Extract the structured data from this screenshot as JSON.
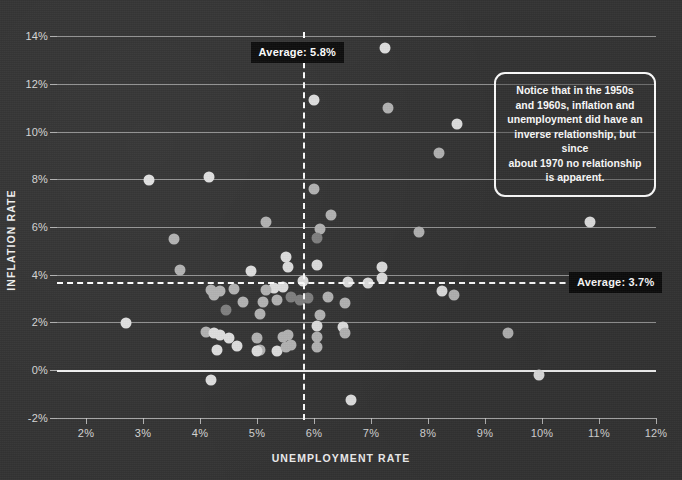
{
  "chart_data": {
    "type": "scatter",
    "title": "",
    "xlabel": "UNEMPLOYMENT RATE",
    "ylabel": "INFLATION RATE",
    "xlim": [
      1.5,
      12.5
    ],
    "ylim": [
      -2,
      14.6
    ],
    "grid": true,
    "x_ticks": [
      "2%",
      "3%",
      "4%",
      "5%",
      "6%",
      "7%",
      "8%",
      "9%",
      "10%",
      "11%",
      "12%"
    ],
    "x_tick_values": [
      2,
      3,
      4,
      5,
      6,
      7,
      8,
      9,
      10,
      11,
      12
    ],
    "y_ticks": [
      "-2%",
      "0%",
      "2%",
      "4%",
      "6%",
      "8%",
      "10%",
      "12%",
      "14%"
    ],
    "y_tick_values": [
      -2,
      0,
      2,
      4,
      6,
      8,
      10,
      12,
      14
    ],
    "reference_lines": [
      {
        "name": "average-unemployment",
        "orientation": "vertical",
        "value": 5.8,
        "label": "Average: 5.8%",
        "style": "dashed",
        "color": "#ffffff"
      },
      {
        "name": "average-inflation",
        "orientation": "horizontal",
        "value": 3.7,
        "label": "Average: 3.7%",
        "style": "dashed",
        "color": "#ffffff"
      }
    ],
    "annotation": "Notice that in the 1950s and 1960s, inflation and unemployment did have an inverse relationship, but since about 1970 no relationship is apparent.",
    "point_color_light": "#e0e0e0",
    "point_color_mid": "#b4b4b4",
    "point_color_dark": "#808080",
    "background_color": "#333333",
    "points": [
      {
        "x": 7.25,
        "y": 13.5,
        "shade": "light"
      },
      {
        "x": 6.0,
        "y": 11.3,
        "shade": "light"
      },
      {
        "x": 7.3,
        "y": 11.0,
        "shade": "mid"
      },
      {
        "x": 8.5,
        "y": 10.3,
        "shade": "light"
      },
      {
        "x": 8.2,
        "y": 9.1,
        "shade": "mid"
      },
      {
        "x": 3.1,
        "y": 7.95,
        "shade": "light"
      },
      {
        "x": 4.15,
        "y": 8.1,
        "shade": "light"
      },
      {
        "x": 6.0,
        "y": 7.6,
        "shade": "mid"
      },
      {
        "x": 6.3,
        "y": 6.5,
        "shade": "mid"
      },
      {
        "x": 5.15,
        "y": 6.2,
        "shade": "mid"
      },
      {
        "x": 6.1,
        "y": 5.9,
        "shade": "mid"
      },
      {
        "x": 6.05,
        "y": 5.55,
        "shade": "dark"
      },
      {
        "x": 10.85,
        "y": 6.2,
        "shade": "light"
      },
      {
        "x": 7.85,
        "y": 5.8,
        "shade": "mid"
      },
      {
        "x": 3.55,
        "y": 5.5,
        "shade": "mid"
      },
      {
        "x": 6.05,
        "y": 4.4,
        "shade": "light"
      },
      {
        "x": 3.65,
        "y": 4.2,
        "shade": "mid"
      },
      {
        "x": 5.5,
        "y": 4.75,
        "shade": "light"
      },
      {
        "x": 5.55,
        "y": 4.3,
        "shade": "light"
      },
      {
        "x": 4.9,
        "y": 4.15,
        "shade": "light"
      },
      {
        "x": 7.2,
        "y": 4.3,
        "shade": "light"
      },
      {
        "x": 7.2,
        "y": 3.85,
        "shade": "light"
      },
      {
        "x": 6.95,
        "y": 3.65,
        "shade": "light"
      },
      {
        "x": 6.6,
        "y": 3.7,
        "shade": "light"
      },
      {
        "x": 5.8,
        "y": 3.75,
        "shade": "light"
      },
      {
        "x": 5.45,
        "y": 3.5,
        "shade": "light"
      },
      {
        "x": 5.3,
        "y": 3.45,
        "shade": "light"
      },
      {
        "x": 5.15,
        "y": 3.35,
        "shade": "mid"
      },
      {
        "x": 4.6,
        "y": 3.4,
        "shade": "mid"
      },
      {
        "x": 4.35,
        "y": 3.3,
        "shade": "mid"
      },
      {
        "x": 4.25,
        "y": 3.15,
        "shade": "mid"
      },
      {
        "x": 4.2,
        "y": 3.35,
        "shade": "mid"
      },
      {
        "x": 5.6,
        "y": 3.05,
        "shade": "dark"
      },
      {
        "x": 5.75,
        "y": 2.95,
        "shade": "dark"
      },
      {
        "x": 5.9,
        "y": 3.0,
        "shade": "dark"
      },
      {
        "x": 5.35,
        "y": 2.95,
        "shade": "mid"
      },
      {
        "x": 5.1,
        "y": 2.85,
        "shade": "mid"
      },
      {
        "x": 4.75,
        "y": 2.85,
        "shade": "mid"
      },
      {
        "x": 6.25,
        "y": 3.05,
        "shade": "mid"
      },
      {
        "x": 8.25,
        "y": 3.3,
        "shade": "light"
      },
      {
        "x": 8.45,
        "y": 3.15,
        "shade": "mid"
      },
      {
        "x": 6.55,
        "y": 2.8,
        "shade": "mid"
      },
      {
        "x": 4.45,
        "y": 2.5,
        "shade": "dark"
      },
      {
        "x": 5.05,
        "y": 2.35,
        "shade": "mid"
      },
      {
        "x": 6.1,
        "y": 2.3,
        "shade": "mid"
      },
      {
        "x": 6.05,
        "y": 1.85,
        "shade": "light"
      },
      {
        "x": 6.5,
        "y": 1.8,
        "shade": "light"
      },
      {
        "x": 6.55,
        "y": 1.55,
        "shade": "mid"
      },
      {
        "x": 2.7,
        "y": 1.95,
        "shade": "light"
      },
      {
        "x": 9.4,
        "y": 1.55,
        "shade": "mid"
      },
      {
        "x": 4.1,
        "y": 1.6,
        "shade": "mid"
      },
      {
        "x": 4.25,
        "y": 1.55,
        "shade": "light"
      },
      {
        "x": 4.35,
        "y": 1.45,
        "shade": "light"
      },
      {
        "x": 4.5,
        "y": 1.35,
        "shade": "light"
      },
      {
        "x": 4.3,
        "y": 0.85,
        "shade": "light"
      },
      {
        "x": 4.65,
        "y": 1.0,
        "shade": "light"
      },
      {
        "x": 5.0,
        "y": 1.35,
        "shade": "mid"
      },
      {
        "x": 5.05,
        "y": 0.85,
        "shade": "mid"
      },
      {
        "x": 5.0,
        "y": 0.8,
        "shade": "light"
      },
      {
        "x": 5.35,
        "y": 0.8,
        "shade": "light"
      },
      {
        "x": 5.45,
        "y": 1.4,
        "shade": "mid"
      },
      {
        "x": 5.5,
        "y": 0.95,
        "shade": "mid"
      },
      {
        "x": 5.55,
        "y": 1.45,
        "shade": "mid"
      },
      {
        "x": 5.6,
        "y": 1.05,
        "shade": "mid"
      },
      {
        "x": 6.05,
        "y": 1.4,
        "shade": "mid"
      },
      {
        "x": 6.05,
        "y": 0.95,
        "shade": "mid"
      },
      {
        "x": 4.2,
        "y": -0.4,
        "shade": "light"
      },
      {
        "x": 9.95,
        "y": -0.2,
        "shade": "light"
      },
      {
        "x": 6.65,
        "y": -1.25,
        "shade": "light"
      }
    ]
  },
  "axes": {
    "x_title": "UNEMPLOYMENT RATE",
    "y_title": "INFLATION RATE"
  },
  "badges": {
    "average_unemployment": "Average: 5.8%",
    "average_inflation": "Average: 3.7%"
  },
  "callout": {
    "line1": "Notice that in the 1950s",
    "line2": "and 1960s, inflation and",
    "line3": "unemployment did have an",
    "line4": "inverse relationship, but since",
    "line5": "about 1970 no relationship",
    "line6": "is apparent."
  }
}
